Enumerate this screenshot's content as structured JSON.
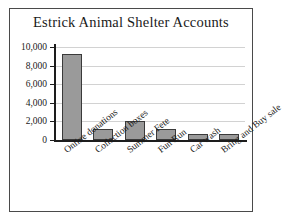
{
  "chart_data": {
    "type": "bar",
    "title": "Estrick Animal Shelter Accounts",
    "xlabel": "",
    "ylabel": "",
    "categories": [
      "Online donations",
      "Collection boxes",
      "Summer Fete",
      "Fun Run",
      "Car wash",
      "Bring and Buy sale"
    ],
    "values": [
      9200,
      1200,
      2050,
      1200,
      600,
      600
    ],
    "ylim": [
      0,
      10000
    ],
    "ytick_labels": [
      "0",
      "2,000",
      "4,000",
      "6,000",
      "8,000",
      "10,000"
    ],
    "ytick_values": [
      0,
      2000,
      4000,
      6000,
      8000,
      10000
    ],
    "grid": true,
    "legend": false,
    "bar_color": "#9a9a9a",
    "bar_edge_color": "#3a3a3a",
    "grid_color": "#d2d2d2",
    "axis_color": "#1d1d1d",
    "text_color": "#1a1a1a",
    "frame_border_color": "#4a4a4a"
  }
}
